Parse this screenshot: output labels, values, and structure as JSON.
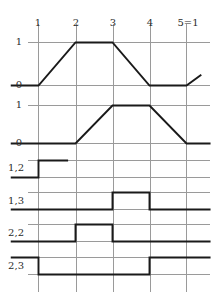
{
  "figure": {
    "title": "",
    "background": "#ffffff",
    "grid_color": "#9a9a9a",
    "trace_color": "#1a1a1a",
    "axis_label_color": "#2b2b2b"
  },
  "chart_data": {
    "type": "line",
    "title": "",
    "xlabel": "",
    "ylabel": "",
    "grid": true,
    "legend": "none",
    "x_tick_labels": [
      "1",
      "2",
      "3",
      "4",
      "5=1"
    ],
    "x_tick_values": [
      1,
      2,
      3,
      4,
      5
    ],
    "xlim": [
      0.25,
      5.65
    ],
    "panels": [
      {
        "name": "panel-1",
        "kind": "piecewise-linear",
        "y_tick_labels": [
          "0",
          "1"
        ],
        "y_tick_values": [
          0,
          1
        ],
        "ylim": [
          0,
          1
        ],
        "points": [
          {
            "x": 0.25,
            "y": 0
          },
          {
            "x": 1,
            "y": 0
          },
          {
            "x": 2,
            "y": 1
          },
          {
            "x": 3,
            "y": 1
          },
          {
            "x": 4,
            "y": 0
          },
          {
            "x": 5,
            "y": 0
          },
          {
            "x": 5.4,
            "y": 0.25
          }
        ]
      },
      {
        "name": "panel-2",
        "kind": "piecewise-linear",
        "y_tick_labels": [
          "0",
          "1"
        ],
        "y_tick_values": [
          0,
          1
        ],
        "ylim": [
          0,
          1
        ],
        "points": [
          {
            "x": 0.25,
            "y": 0
          },
          {
            "x": 2,
            "y": 0
          },
          {
            "x": 3,
            "y": 1
          },
          {
            "x": 4,
            "y": 1
          },
          {
            "x": 5,
            "y": 0
          },
          {
            "x": 5.65,
            "y": 0
          }
        ]
      },
      {
        "name": "panel-3",
        "label": "1,2",
        "kind": "step",
        "points": [
          {
            "x": 0.25,
            "y": 0
          },
          {
            "x": 1,
            "y": 0
          },
          {
            "x": 1,
            "y": 1
          },
          {
            "x": 1.8,
            "y": 1
          }
        ]
      },
      {
        "name": "panel-4",
        "label": "1,3",
        "kind": "step",
        "points": [
          {
            "x": 0.25,
            "y": 0
          },
          {
            "x": 3,
            "y": 0
          },
          {
            "x": 3,
            "y": 1
          },
          {
            "x": 4,
            "y": 1
          },
          {
            "x": 4,
            "y": 0
          },
          {
            "x": 5.65,
            "y": 0
          }
        ]
      },
      {
        "name": "panel-5",
        "label": "2,2",
        "kind": "step",
        "points": [
          {
            "x": 0.25,
            "y": 0
          },
          {
            "x": 2,
            "y": 0
          },
          {
            "x": 2,
            "y": 1
          },
          {
            "x": 3,
            "y": 1
          },
          {
            "x": 3,
            "y": 0
          },
          {
            "x": 5.65,
            "y": 0
          }
        ]
      },
      {
        "name": "panel-6",
        "label": "2,3",
        "kind": "step",
        "points": [
          {
            "x": 0.25,
            "y": 1
          },
          {
            "x": 1,
            "y": 1
          },
          {
            "x": 1,
            "y": 0
          },
          {
            "x": 4,
            "y": 0
          },
          {
            "x": 4,
            "y": 1
          },
          {
            "x": 5.65,
            "y": 1
          }
        ]
      }
    ]
  },
  "labels": {
    "columns": [
      {
        "text": "1",
        "x": 38,
        "y": 18
      },
      {
        "text": "2",
        "x": 76,
        "y": 18
      },
      {
        "text": "3",
        "x": 113,
        "y": 18
      },
      {
        "text": "4",
        "x": 150,
        "y": 18
      },
      {
        "text": "5=1",
        "x": 188,
        "y": 18
      }
    ],
    "values": [
      {
        "text": "1",
        "x": 22,
        "y": 37
      },
      {
        "text": "0",
        "x": 22,
        "y": 80
      },
      {
        "text": "1",
        "x": 22,
        "y": 100
      },
      {
        "text": "0",
        "x": 22,
        "y": 138
      }
    ],
    "rows": [
      {
        "text": "1,2",
        "x": 24,
        "y": 163
      },
      {
        "text": "1,3",
        "x": 24,
        "y": 196
      },
      {
        "text": "2,2",
        "x": 24,
        "y": 228
      },
      {
        "text": "2,3",
        "x": 24,
        "y": 261
      }
    ]
  }
}
